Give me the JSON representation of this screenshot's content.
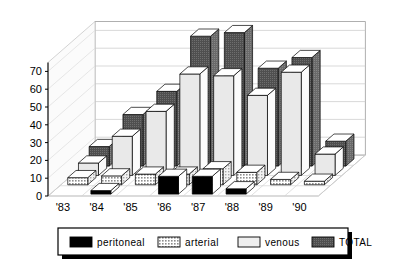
{
  "chart_data": {
    "type": "bar",
    "title": "",
    "subtitle": "",
    "xlabel": "",
    "ylabel": "",
    "categories": [
      "'83",
      "'84",
      "'85",
      "'86",
      "'87",
      "'88",
      "'89",
      "'90"
    ],
    "ylim": [
      0,
      75
    ],
    "yticks": [
      0,
      10,
      20,
      30,
      40,
      50,
      60,
      70
    ],
    "ytick_labels": [
      "0",
      "10",
      "20",
      "30",
      "40",
      "50",
      "60",
      "70"
    ],
    "grid": true,
    "grid_axis": "y",
    "projection": "3d",
    "legend_position": "bottom",
    "series": [
      {
        "name": "peritoneal",
        "color": "#000000",
        "pattern": "solid",
        "values": [
          0,
          2,
          0,
          10,
          10,
          3,
          0,
          0
        ]
      },
      {
        "name": "arterial",
        "color": "#9a9a9a",
        "pattern": "hatched",
        "values": [
          4,
          5,
          6,
          6,
          9,
          7,
          3,
          2
        ]
      },
      {
        "name": "venous",
        "color": "#e8e8e8",
        "pattern": "light",
        "values": [
          7,
          22,
          36,
          57,
          56,
          45,
          58,
          12
        ]
      },
      {
        "name": "TOTAL",
        "color": "#5a5a5a",
        "pattern": "dark",
        "values": [
          11,
          29,
          42,
          73,
          75,
          55,
          61,
          14
        ]
      }
    ]
  },
  "legend": {
    "items": [
      {
        "label": "peritoneal",
        "swatch": "peritoneal-swatch"
      },
      {
        "label": "arterial",
        "swatch": "arterial-swatch"
      },
      {
        "label": "venous",
        "swatch": "venous-swatch"
      },
      {
        "label": "TOTAL",
        "swatch": "total-swatch"
      }
    ]
  },
  "axis": {
    "y_labels": [
      "70",
      "60",
      "50",
      "40",
      "30",
      "20",
      "10",
      "0"
    ],
    "x_labels": [
      "'83",
      "'84",
      "'85",
      "'86",
      "'87",
      "'88",
      "'89",
      "'90"
    ]
  }
}
